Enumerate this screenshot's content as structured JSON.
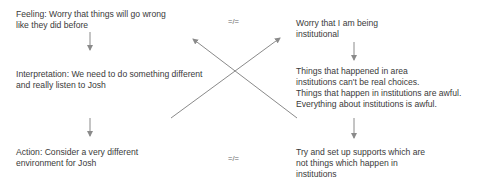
{
  "left": {
    "feeling": "Feeling:   Worry that things will go wrong\nlike they did before",
    "interpretation": "Interpretation: We need to do something different\nand really listen to Josh",
    "action": "Action: Consider a very different\nenvironment for Josh"
  },
  "right": {
    "feeling": "Worry that I am being\ninstitutional",
    "interpretation": "Things that happened in area\ninstitutions can't be real choices.\nThings that happen in institutions are awful.\nEverything about institutions is awful.",
    "action": "Try and set up supports which are\nnot things which happen in\ninstitutions"
  },
  "separators": {
    "top": "=/=",
    "bottom": "=/="
  },
  "colors": {
    "text": "#3a3a3a",
    "arrow": "#8a8a8a"
  }
}
